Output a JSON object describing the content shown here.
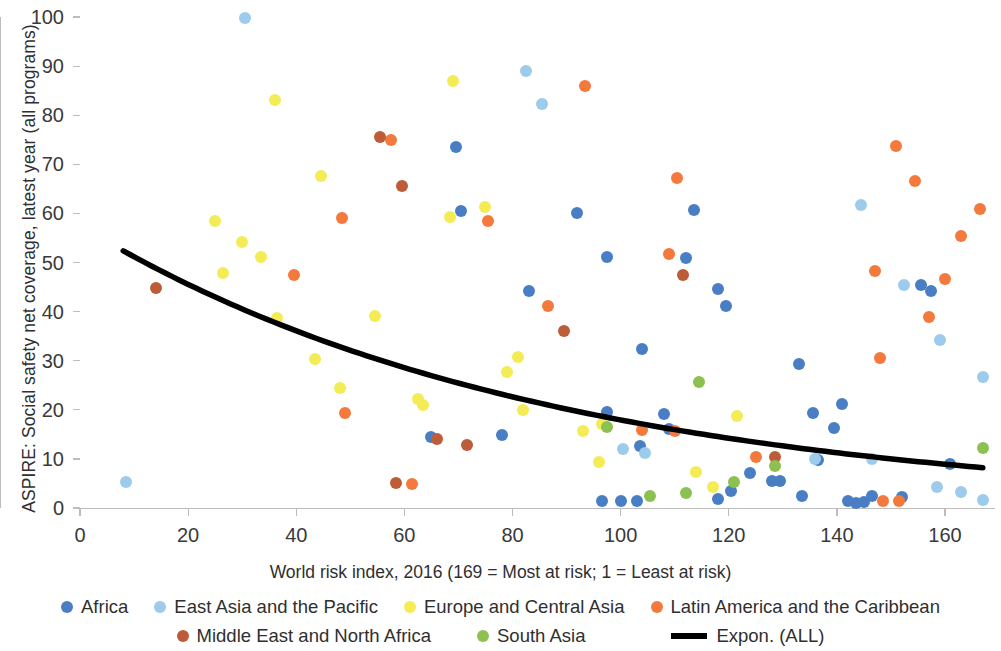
{
  "chart_data": {
    "type": "scatter",
    "title": "",
    "xlabel": "World risk index, 2016 (169 = Most at risk; 1 = Least at risk)",
    "ylabel": "ASPIRE: Social safety net coverage, latest year (all programs)",
    "xlim": [
      0,
      168
    ],
    "ylim": [
      0,
      100
    ],
    "xticks": [
      0,
      20,
      40,
      60,
      80,
      100,
      120,
      140,
      160
    ],
    "yticks": [
      0,
      10,
      20,
      30,
      40,
      50,
      60,
      70,
      80,
      90,
      100
    ],
    "grid": false,
    "legend_position": "bottom",
    "colors": {
      "Africa": "#4a7ec4",
      "East Asia and the Pacific": "#9ccbec",
      "Europe and Central Asia": "#f3ec54",
      "Latin America and the Caribbean": "#f4793c",
      "Middle East and North Africa": "#bd5c38",
      "South Asia": "#8cc152",
      "Expon. (ALL)": "#000000"
    },
    "series": [
      {
        "name": "Africa",
        "color": "#4a7ec4",
        "points": [
          [
            69.5,
            73.5
          ],
          [
            70.5,
            60.5
          ],
          [
            83,
            44.2
          ],
          [
            92,
            60.0
          ],
          [
            97.5,
            51.1
          ],
          [
            104,
            32.3
          ],
          [
            113.5,
            60.6
          ],
          [
            112,
            51.0
          ],
          [
            118,
            44.6
          ],
          [
            119.5,
            41.2
          ],
          [
            108,
            19.2
          ],
          [
            103.5,
            12.6
          ],
          [
            133,
            29.4
          ],
          [
            135.5,
            19.4
          ],
          [
            141,
            21.2
          ],
          [
            124,
            7.1
          ],
          [
            128,
            5.6
          ],
          [
            129.5,
            5.6
          ],
          [
            120.5,
            3.4
          ],
          [
            97.5,
            19.6
          ],
          [
            96.5,
            1.5
          ],
          [
            100,
            1.4
          ],
          [
            103,
            1.4
          ],
          [
            118,
            1.9
          ],
          [
            133.5,
            2.4
          ],
          [
            142,
            1.5
          ],
          [
            143.5,
            1.0
          ],
          [
            145,
            1.3
          ],
          [
            146.5,
            2.4
          ],
          [
            155.5,
            45.5
          ],
          [
            157.5,
            44.2
          ],
          [
            161,
            9.0
          ],
          [
            136.5,
            9.8
          ],
          [
            65,
            14.5
          ],
          [
            109,
            16.0
          ],
          [
            139.5,
            16.3
          ],
          [
            152,
            2.3
          ],
          [
            78,
            14.9
          ]
        ]
      },
      {
        "name": "East Asia and the Pacific",
        "color": "#9ccbec",
        "points": [
          [
            30.5,
            99.8
          ],
          [
            82.5,
            89.0
          ],
          [
            85.5,
            82.3
          ],
          [
            8.5,
            5.2
          ],
          [
            144.5,
            61.8
          ],
          [
            100.5,
            12.1
          ],
          [
            104.5,
            11.1
          ],
          [
            152.5,
            45.5
          ],
          [
            159,
            34.2
          ],
          [
            167,
            26.6
          ],
          [
            163,
            3.3
          ],
          [
            167,
            1.7
          ],
          [
            146.5,
            9.9
          ],
          [
            158.5,
            4.3
          ],
          [
            136,
            10.0
          ]
        ]
      },
      {
        "name": "Europe and Central Asia",
        "color": "#f3ec54",
        "points": [
          [
            36,
            83.0
          ],
          [
            69,
            87.0
          ],
          [
            44.5,
            67.7
          ],
          [
            75,
            61.3
          ],
          [
            68.5,
            59.3
          ],
          [
            25,
            58.5
          ],
          [
            30,
            54.1
          ],
          [
            33.5,
            51.2
          ],
          [
            26.5,
            47.8
          ],
          [
            36.5,
            38.6
          ],
          [
            54.5,
            39.2
          ],
          [
            43.5,
            30.3
          ],
          [
            81,
            30.8
          ],
          [
            79,
            27.8
          ],
          [
            48,
            24.4
          ],
          [
            82,
            20.0
          ],
          [
            63.5,
            20.9
          ],
          [
            62.5,
            22.1
          ],
          [
            93,
            15.7
          ],
          [
            96.5,
            17.2
          ],
          [
            96,
            9.4
          ],
          [
            114,
            7.3
          ],
          [
            117,
            4.2
          ],
          [
            121.5,
            18.7
          ]
        ]
      },
      {
        "name": "Latin America and the Caribbean",
        "color": "#f4793c",
        "points": [
          [
            93.5,
            86.0
          ],
          [
            151,
            73.7
          ],
          [
            110.5,
            67.3
          ],
          [
            154.5,
            66.6
          ],
          [
            48.5,
            59.0
          ],
          [
            75.5,
            58.4
          ],
          [
            166.5,
            60.8
          ],
          [
            163,
            55.4
          ],
          [
            160,
            46.7
          ],
          [
            147,
            48.3
          ],
          [
            109,
            51.8
          ],
          [
            39.5,
            47.5
          ],
          [
            57.5,
            75.0
          ],
          [
            86.5,
            41.2
          ],
          [
            157,
            38.9
          ],
          [
            148,
            30.6
          ],
          [
            49,
            19.4
          ],
          [
            110,
            15.6
          ],
          [
            104,
            15.8
          ],
          [
            125,
            10.3
          ],
          [
            61.5,
            4.8
          ],
          [
            148.5,
            1.5
          ],
          [
            151.5,
            1.4
          ]
        ]
      },
      {
        "name": "Middle East and North Africa",
        "color": "#bd5c38",
        "points": [
          [
            55.5,
            75.5
          ],
          [
            59.5,
            65.5
          ],
          [
            14,
            44.9
          ],
          [
            89.5,
            36.0
          ],
          [
            111.5,
            47.5
          ],
          [
            66,
            14.1
          ],
          [
            71.5,
            12.8
          ],
          [
            58.5,
            5.1
          ],
          [
            128.5,
            10.4
          ]
        ]
      },
      {
        "name": "South Asia",
        "color": "#8cc152",
        "points": [
          [
            114.5,
            25.6
          ],
          [
            97.5,
            16.5
          ],
          [
            128.5,
            8.5
          ],
          [
            121,
            5.3
          ],
          [
            105.5,
            2.4
          ],
          [
            167,
            12.2
          ],
          [
            112,
            3.0
          ]
        ]
      }
    ],
    "trendline": {
      "label": "Expon. (ALL)",
      "type": "exponential",
      "color": "#000000",
      "x_start": 8,
      "x_end": 167,
      "y_start": 54,
      "y_end": 8.6,
      "a": 57.5,
      "b": -0.01165
    }
  },
  "axes": {
    "y_title": "ASPIRE: Social safety net coverage, latest year (all programs)",
    "x_title": "World risk index, 2016 (169 = Most at risk; 1 = Least at risk)",
    "y_tick_labels": [
      "0",
      "10",
      "20",
      "30",
      "40",
      "50",
      "60",
      "70",
      "80",
      "90",
      "100"
    ],
    "x_tick_labels": [
      "0",
      "20",
      "40",
      "60",
      "80",
      "100",
      "120",
      "140",
      "160"
    ]
  },
  "legend": {
    "rows": [
      [
        {
          "label": "Africa",
          "marker": "dot",
          "color": "#4a7ec4"
        },
        {
          "label": "East Asia and the Pacific",
          "marker": "dot",
          "color": "#9ccbec"
        },
        {
          "label": "Europe and Central Asia",
          "marker": "dot",
          "color": "#f3ec54"
        },
        {
          "label": "Latin America and the Caribbean",
          "marker": "dot",
          "color": "#f4793c"
        }
      ],
      [
        {
          "label": "Middle East and North Africa",
          "marker": "dot",
          "color": "#bd5c38"
        },
        {
          "label": "South Asia",
          "marker": "dot",
          "color": "#8cc152"
        },
        {
          "label": "Expon. (ALL)",
          "marker": "line",
          "color": "#000000"
        }
      ]
    ]
  }
}
